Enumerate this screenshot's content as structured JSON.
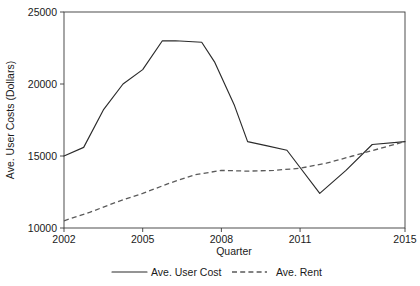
{
  "chart_data": {
    "type": "line",
    "title": "",
    "xlabel": "Quarter",
    "ylabel": "Ave. User Costs (Dollars)",
    "xlim": [
      2002,
      2015
    ],
    "ylim": [
      10000,
      25000
    ],
    "xticks": [
      "2002",
      "2005",
      "2008",
      "2011",
      "2015"
    ],
    "xtick_values": [
      2002,
      2005,
      2008,
      2011,
      2015
    ],
    "yticks": [
      "10000",
      "15000",
      "20000",
      "25000"
    ],
    "ytick_values": [
      10000,
      15000,
      20000,
      25000
    ],
    "grid": false,
    "legend_position": "below",
    "series": [
      {
        "name": "Ave. User Cost",
        "style": "solid",
        "color": "#2b2b2b",
        "x": [
          2002,
          2002.75,
          2003.5,
          2004.25,
          2005,
          2005.75,
          2006.25,
          2007.25,
          2007.75,
          2008.5,
          2009,
          2009.75,
          2010.5,
          2011,
          2011.75,
          2012.75,
          2013.75,
          2015
        ],
        "y": [
          15000,
          15600,
          18200,
          20000,
          21000,
          23000,
          23000,
          22900,
          21500,
          18500,
          16000,
          15700,
          15400,
          14200,
          12400,
          14000,
          15800,
          16000
        ]
      },
      {
        "name": "Ave. Rent",
        "style": "dashed",
        "color": "#5a5a5a",
        "x": [
          2002,
          2003,
          2004,
          2005,
          2006,
          2007,
          2008,
          2009,
          2010,
          2011,
          2012,
          2013,
          2014,
          2015
        ],
        "y": [
          10500,
          11100,
          11800,
          12400,
          13100,
          13700,
          14000,
          13950,
          14000,
          14150,
          14500,
          15000,
          15500,
          16000
        ]
      }
    ]
  },
  "legend": {
    "entries": [
      {
        "label": "Ave. User Cost",
        "style": "solid"
      },
      {
        "label": "Ave. Rent",
        "style": "dashed"
      }
    ]
  },
  "axes": {
    "x_title": "Quarter",
    "y_title": "Ave. User Costs (Dollars)"
  }
}
